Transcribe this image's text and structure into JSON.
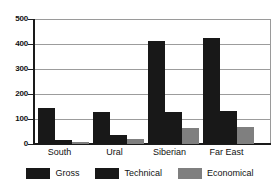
{
  "chart_data": {
    "type": "bar",
    "title": "",
    "xlabel": "",
    "ylabel": "",
    "categories": [
      "South",
      "Ural",
      "Siberian",
      "Far East"
    ],
    "series": [
      {
        "name": "Gross",
        "color": "#181818",
        "values": [
          145,
          127,
          410,
          423
        ]
      },
      {
        "name": "Technical",
        "color": "#181818",
        "values": [
          16,
          37,
          127,
          132
        ]
      },
      {
        "name": "Economical",
        "color": "#7f7f7f",
        "values": [
          8,
          18,
          63,
          67
        ]
      }
    ],
    "ylim": [
      0,
      500
    ],
    "yticks": [
      0,
      100,
      200,
      300,
      400,
      500
    ],
    "ytick_labels": [
      "0",
      "100",
      "200",
      "300",
      "400",
      "500"
    ],
    "grid": true,
    "grid_axis": "y",
    "legend_position": "bottom",
    "legend_entries": [
      "Gross",
      "Technical",
      "Economical"
    ]
  },
  "colors": {
    "background": "#ffffff",
    "axis": "#1a1a1a",
    "grid": "#9c9c9c",
    "dark_series": "#181818",
    "gray_series": "#7f7f7f"
  }
}
